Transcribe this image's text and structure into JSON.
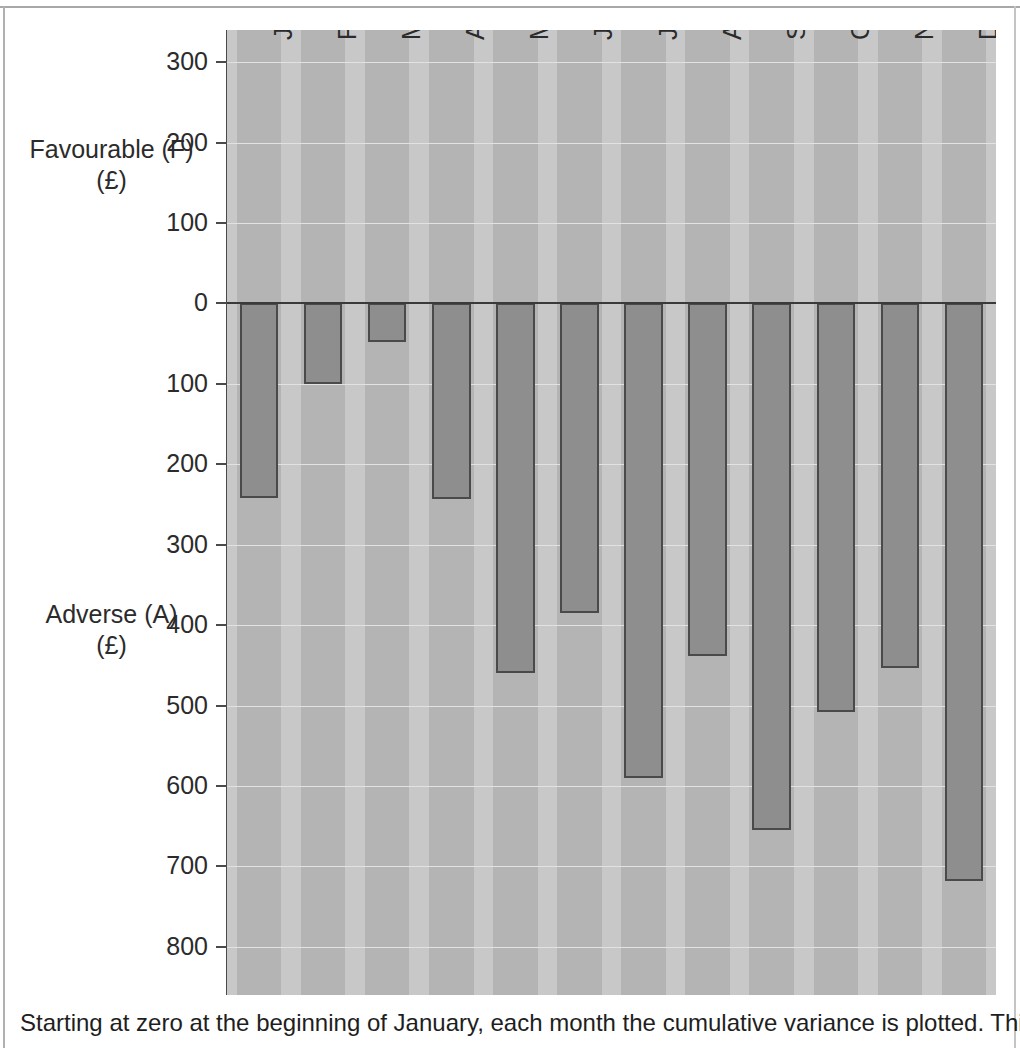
{
  "chart_data": {
    "type": "bar",
    "title": "",
    "subtitle": "",
    "xlabel": "",
    "ylabel": "",
    "categories": [
      "Jan",
      "Feb",
      "Mar",
      "Apr",
      "May",
      "June",
      "July",
      "Aug",
      "Sept",
      "Oct",
      "Nov",
      "Dec"
    ],
    "series": [
      {
        "name": "Cumulative variance",
        "values": [
          -242,
          -100,
          -48,
          -243,
          -460,
          -385,
          -590,
          -438,
          -655,
          -508,
          -453,
          -718
        ]
      }
    ],
    "values": [
      -242,
      -100,
      -48,
      -243,
      -460,
      -385,
      -590,
      -438,
      -655,
      -508,
      -453,
      -718
    ],
    "ylim": [
      -860,
      340
    ],
    "y_ticks": [
      300,
      200,
      100,
      0,
      -100,
      -200,
      -300,
      -400,
      -500,
      -600,
      -700,
      -800
    ],
    "y_tick_labels": [
      "300",
      "200",
      "100",
      "0",
      "100",
      "200",
      "300",
      "400",
      "500",
      "600",
      "700",
      "800"
    ],
    "grid": true,
    "legend": "none",
    "axis_titles": {
      "upper": "Favourable (F)",
      "upper_unit": "(£)",
      "lower": "Adverse (A)",
      "lower_unit": "(£)"
    },
    "colors": {
      "bar_fill": "#8e8e8e",
      "bar_border": "#4a4a4a",
      "plot_background_light": "#c8c8c8",
      "plot_background_band": "#b4b4b4",
      "zero_line": "#3a3a3a",
      "gridline": "#e2e2e2",
      "text": "#2b2b2b"
    }
  },
  "caption": {
    "text": "Starting at zero at the beginning of January, each month the cumulative variance is plotted. This"
  }
}
